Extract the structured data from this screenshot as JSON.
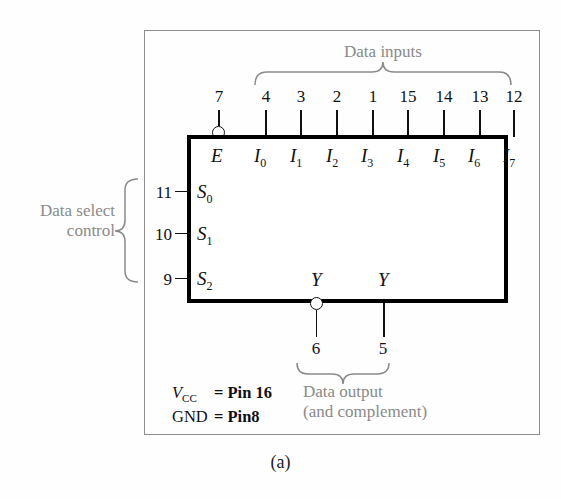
{
  "figure": {
    "caption": "(a)",
    "device": "8-to-1 multiplexer logic block symbol"
  },
  "annotations": {
    "data_inputs": "Data inputs",
    "data_select_line1": "Data select",
    "data_select_line2": "control",
    "data_output_line1": "Data output",
    "data_output_line2": "(and complement)"
  },
  "enable": {
    "pin": "7",
    "label": "E",
    "active_low": true
  },
  "data_inputs": [
    {
      "pin": "4",
      "label": "I",
      "sub": "0"
    },
    {
      "pin": "3",
      "label": "I",
      "sub": "1"
    },
    {
      "pin": "2",
      "label": "I",
      "sub": "2"
    },
    {
      "pin": "1",
      "label": "I",
      "sub": "3"
    },
    {
      "pin": "15",
      "label": "I",
      "sub": "4"
    },
    {
      "pin": "14",
      "label": "I",
      "sub": "5"
    },
    {
      "pin": "13",
      "label": "I",
      "sub": "6"
    },
    {
      "pin": "12",
      "label": "I",
      "sub": "7"
    }
  ],
  "select_inputs": [
    {
      "pin": "11",
      "label": "S",
      "sub": "0"
    },
    {
      "pin": "10",
      "label": "S",
      "sub": "1"
    },
    {
      "pin": "9",
      "label": "S",
      "sub": "2"
    }
  ],
  "outputs": [
    {
      "pin": "6",
      "label": "Y",
      "complement": true
    },
    {
      "pin": "5",
      "label": "Y",
      "complement": false
    }
  ],
  "power": {
    "vcc_name": "V",
    "vcc_sub": "CC",
    "vcc_eq": "= Pin 16",
    "gnd_name": "GND",
    "gnd_eq": "= Pin8"
  },
  "colors": {
    "ink": "#111111",
    "annotation": "#8a8a8a",
    "frame": "#8d8d8d",
    "background": "#fefefe"
  }
}
